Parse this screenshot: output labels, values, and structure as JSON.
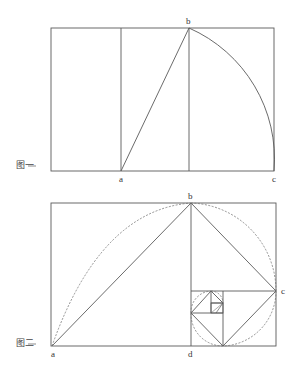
{
  "figure1": {
    "caption": "图一",
    "points": {
      "a": "a",
      "b": "b",
      "c": "c"
    },
    "geometry": {
      "rect": {
        "x1": 51,
        "y1": 28,
        "x2": 274,
        "y2": 171
      },
      "vertical_lines_x": [
        121,
        189
      ],
      "segment_ab": [
        [
          121,
          171
        ],
        [
          189,
          28
        ]
      ],
      "arc_bc": {
        "center": [
          274,
          171
        ],
        "from": [
          189,
          28
        ],
        "to": [
          274,
          171
        ]
      }
    }
  },
  "figure2": {
    "caption": "图二",
    "points": {
      "a": "a",
      "b": "b",
      "c": "c",
      "d": "d"
    },
    "geometry": {
      "rect": {
        "x1": 51,
        "y1": 203,
        "x2": 276,
        "y2": 346
      },
      "vertical_line_x": 191,
      "triangle": [
        [
          52,
          346
        ],
        [
          191,
          203
        ],
        [
          276,
          291
        ]
      ],
      "dashed_arcs": "golden spiral construction"
    }
  },
  "colors": {
    "stroke": "#555555",
    "dashed": "#777777",
    "text": "#333333"
  }
}
